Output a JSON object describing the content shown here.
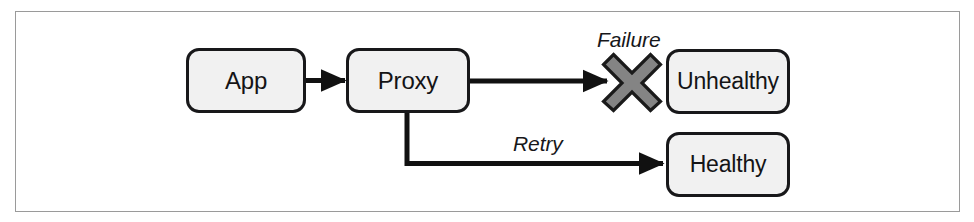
{
  "diagram": {
    "frame": {
      "border_color": "#9a9a9a",
      "background": "#ffffff"
    },
    "style": {
      "node_fill": "#f1f1f1",
      "node_stroke": "#18181a",
      "edge_color": "#111111",
      "failure_marker_fill": "#848484",
      "failure_marker_stroke": "#1a1a1a"
    },
    "nodes": [
      {
        "id": "app",
        "label": "App"
      },
      {
        "id": "proxy",
        "label": "Proxy"
      },
      {
        "id": "unhealthy",
        "label": "Unhealthy"
      },
      {
        "id": "healthy",
        "label": "Healthy"
      }
    ],
    "edges": [
      {
        "id": "app-to-proxy",
        "from": "app",
        "to": "proxy",
        "label": ""
      },
      {
        "id": "proxy-to-unhealthy",
        "from": "proxy",
        "to": "unhealthy",
        "label": "Failure"
      },
      {
        "id": "proxy-to-healthy",
        "from": "proxy",
        "to": "healthy",
        "label": "Retry"
      }
    ],
    "markers": [
      {
        "id": "failure-x",
        "kind": "cross-icon",
        "label": "Failure"
      }
    ],
    "labels": {
      "failure": "Failure",
      "retry": "Retry"
    }
  }
}
